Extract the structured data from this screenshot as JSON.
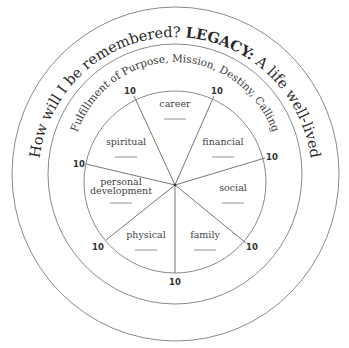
{
  "title": {
    "question": "How will I be remembered? ",
    "legacy": "LEGACY:",
    "tagline": " A life well-lived"
  },
  "subtitle": "Fulfillment of Purpose, Mission, Destiny, Calling",
  "wheel": {
    "max_score": "10",
    "segments": [
      {
        "label": "career",
        "score": "10"
      },
      {
        "label": "financial",
        "score": "10"
      },
      {
        "label": "social",
        "score": "10"
      },
      {
        "label": "family",
        "score": "10"
      },
      {
        "label": "physical",
        "score": "10"
      },
      {
        "label_line1": "personal",
        "label_line2": "development",
        "score": "10"
      },
      {
        "label": "spiritual",
        "score": "10"
      }
    ]
  },
  "scores": {
    "top_left": "10",
    "top_right": "10",
    "right": "10",
    "lower_right": "10",
    "bottom": "10",
    "lower_left": "10",
    "left": "10"
  }
}
